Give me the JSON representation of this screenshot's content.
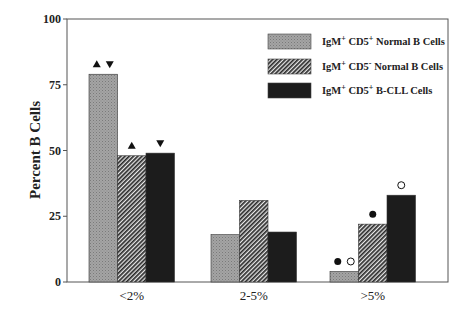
{
  "chart_data": {
    "type": "bar",
    "title": "",
    "xlabel": "",
    "ylabel": "Percent B Cells",
    "ylim": [
      0,
      100
    ],
    "yticks": [
      0,
      25,
      50,
      75,
      100
    ],
    "grid": false,
    "legend_position": "upper-right",
    "categories": [
      "<2%",
      "2-5%",
      ">5%"
    ],
    "series": [
      {
        "name": "IgM+ CD5+ Normal B Cells",
        "pattern": "gray-stipple",
        "color": "#9a9a9a",
        "values": [
          79,
          18,
          4
        ]
      },
      {
        "name": "IgM+ CD5- Normal B Cells",
        "pattern": "diagonal-hatch",
        "color": "#555555",
        "values": [
          48,
          31,
          22
        ]
      },
      {
        "name": "IgM+ CD5+ B-CLL Cells",
        "pattern": "solid-black",
        "color": "#1a1a1a",
        "values": [
          49,
          19,
          33
        ]
      }
    ],
    "legend": [
      {
        "base": "IgM",
        "sup1": "+",
        "mid": " CD5",
        "sup2": "+",
        "rest": " Normal B Cells"
      },
      {
        "base": "IgM",
        "sup1": "+",
        "mid": " CD5",
        "sup2": "-",
        "rest": " Normal B Cells"
      },
      {
        "base": "IgM",
        "sup1": "+",
        "mid": " CD5",
        "sup2": "+",
        "rest": " B-CLL Cells"
      }
    ],
    "annotations": [
      {
        "category": "<2%",
        "series": 0,
        "markers": [
          "triangle-up",
          "triangle-down"
        ]
      },
      {
        "category": "<2%",
        "series": 1,
        "markers": [
          "triangle-up"
        ]
      },
      {
        "category": "<2%",
        "series": 2,
        "markers": [
          "triangle-down"
        ]
      },
      {
        "category": ">5%",
        "series": 0,
        "markers": [
          "filled-circle",
          "open-circle"
        ]
      },
      {
        "category": ">5%",
        "series": 1,
        "markers": [
          "filled-circle"
        ]
      },
      {
        "category": ">5%",
        "series": 2,
        "markers": [
          "open-circle"
        ]
      }
    ]
  }
}
